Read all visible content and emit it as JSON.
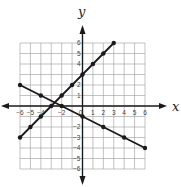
{
  "chart_data": {
    "type": "line",
    "title": "",
    "xlabel": "x",
    "ylabel": "y",
    "xlim": [
      -6,
      6
    ],
    "ylim": [
      -6,
      6
    ],
    "grid": true,
    "x_ticks": [
      "-6",
      "-5",
      "-4",
      "-2",
      "0",
      "1",
      "2",
      "3",
      "4",
      "5",
      "6"
    ],
    "y_ticks": [
      "6",
      "5",
      "4",
      "2",
      "1",
      "-2",
      "-3",
      "-4",
      "-5",
      "-6"
    ],
    "series": [
      {
        "name": "line-1",
        "equation": "y = x + 3",
        "points": [
          [
            -6,
            -3
          ],
          [
            -5,
            -2
          ],
          [
            -4,
            -1
          ],
          [
            -3,
            0
          ],
          [
            -2,
            1
          ],
          [
            -1,
            2
          ],
          [
            0,
            3
          ],
          [
            1,
            4
          ],
          [
            2,
            5
          ],
          [
            3,
            6
          ]
        ]
      },
      {
        "name": "line-2",
        "equation": "y = -0.5x - 1",
        "points": [
          [
            -6,
            2
          ],
          [
            -4,
            1
          ],
          [
            -2,
            0
          ],
          [
            0,
            -1
          ],
          [
            2,
            -2
          ],
          [
            4,
            -3
          ],
          [
            6,
            -4
          ]
        ]
      }
    ],
    "colors": {
      "grid": "#9a9a9a",
      "axis": "#1a1a1a",
      "line": "#1a1a1a"
    }
  }
}
